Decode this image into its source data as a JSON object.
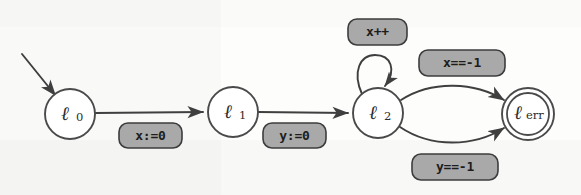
{
  "figure": {
    "type": "finite-state-automaton",
    "kind": "control-flow-graph",
    "background_color": "#fdfdfc",
    "stroke_color": "#3f3f3f",
    "label_box_fill": "#a9a9a9",
    "label_text_color": "#1d1d1d"
  },
  "nodes": [
    {
      "id": "l0",
      "base": "ℓ",
      "subscript": "0",
      "full_label": "ℓ0",
      "shape": "circle",
      "accepting": false,
      "initial": true,
      "cx": 70,
      "cy": 114,
      "r": 25
    },
    {
      "id": "l1",
      "base": "ℓ",
      "subscript": "1",
      "full_label": "ℓ1",
      "shape": "circle",
      "accepting": false,
      "initial": false,
      "cx": 233,
      "cy": 112,
      "r": 25
    },
    {
      "id": "l2",
      "base": "ℓ",
      "subscript": "2",
      "full_label": "ℓ2",
      "shape": "circle",
      "accepting": false,
      "initial": false,
      "cx": 378,
      "cy": 113,
      "r": 25
    },
    {
      "id": "lerr",
      "base": "ℓ",
      "subscript": "err",
      "full_label": "ℓerr",
      "shape": "double-circle",
      "accepting": true,
      "initial": false,
      "cx": 528,
      "cy": 114,
      "r": 26,
      "r_inner": 21
    }
  ],
  "initial_arrow": {
    "from_x": 22,
    "from_y": 54,
    "to_x": 55,
    "to_y": 95
  },
  "edges": [
    {
      "id": "e-l0-l1",
      "from": "l0",
      "to": "l1",
      "style": "straight",
      "label": "x:=0",
      "label_x": 151,
      "label_y": 136
    },
    {
      "id": "e-l1-l2",
      "from": "l1",
      "to": "l2",
      "style": "straight",
      "label": "y:=0",
      "label_x": 295,
      "label_y": 136
    },
    {
      "id": "e-l2-l2",
      "from": "l2",
      "to": "l2",
      "style": "self-loop",
      "label": "x++",
      "label_x": 378,
      "label_y": 32
    },
    {
      "id": "e-l2-lerr-top",
      "from": "l2",
      "to": "lerr",
      "style": "curve-up",
      "label": "x==-1",
      "label_x": 462,
      "label_y": 63
    },
    {
      "id": "e-l2-lerr-bottom",
      "from": "l2",
      "to": "lerr",
      "style": "curve-down",
      "label": "y==-1",
      "label_x": 455,
      "label_y": 167
    }
  ],
  "labels": {
    "x_assign_0": "x:=0",
    "y_assign_0": "y:=0",
    "x_increment": "x++",
    "x_equals_minus1": "x==-1",
    "y_equals_minus1": "y==-1"
  }
}
